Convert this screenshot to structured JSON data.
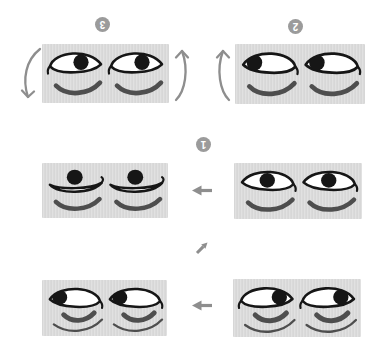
{
  "figure": {
    "kind": "instruction-diagram",
    "colors": {
      "background": "#ffffff",
      "card_fill": "#dcdcdc",
      "ink": "#161616",
      "sclera": "#ffffff",
      "underline_gray": "#4e4e4e",
      "arrow_gray": "#8e8e8e",
      "badge_gray": "#9b9b9b",
      "badge_text": "#ffffff"
    }
  },
  "badges": [
    {
      "id": "badge-3",
      "label": "3",
      "upside_down": true
    },
    {
      "id": "badge-2",
      "label": "2",
      "upside_down": true
    },
    {
      "id": "badge-1",
      "label": "1",
      "upside_down": true
    }
  ],
  "panels": [
    {
      "id": "card-step-3",
      "position": "top-left",
      "eyes": 2,
      "eye_style": "lid-left-curl",
      "gaze": "down-right",
      "pupil": {
        "x": 36,
        "y": 18
      },
      "under": "single"
    },
    {
      "id": "card-step-2",
      "position": "top-right",
      "eyes": 2,
      "eye_style": "lid-right-curl",
      "gaze": "down-left",
      "pupil": {
        "x": 16,
        "y": 18
      },
      "under": "single"
    },
    {
      "id": "card-result",
      "position": "middle-left",
      "eyes": 2,
      "eye_style": "boat",
      "gaze": "up",
      "pupil": {
        "x": 30,
        "y": 15
      },
      "under": "single"
    },
    {
      "id": "card-step-1",
      "position": "middle-right",
      "eyes": 2,
      "eye_style": "lid-right-curl",
      "gaze": "down-center",
      "pupil": {
        "x": 30,
        "y": 18
      },
      "under": "single"
    },
    {
      "id": "card-start-left",
      "position": "bottom-left",
      "eyes": 2,
      "eye_style": "lid-right-curl",
      "gaze": "left",
      "pupil": {
        "x": 15,
        "y": 18
      },
      "under": "double"
    },
    {
      "id": "card-start-right",
      "position": "bottom-right",
      "eyes": 2,
      "eye_style": "lid-left-curl",
      "gaze": "right",
      "pupil": {
        "x": 43,
        "y": 18
      },
      "under": "double"
    }
  ],
  "arrows": [
    {
      "id": "arrow-rotate-left",
      "type": "curved-down",
      "meaning": "left edge rotates down"
    },
    {
      "id": "arrow-rotate-right",
      "type": "curved-up",
      "meaning": "right edge rotates up"
    },
    {
      "id": "arrow-rotate-right2",
      "type": "curved-up",
      "meaning": "left edge of card 2 rotates up"
    },
    {
      "id": "arrow-mid-left",
      "type": "left",
      "meaning": "card 1 becomes middle-left card"
    },
    {
      "id": "arrow-diag",
      "type": "up-right",
      "meaning": "continue sequence upward"
    },
    {
      "id": "arrow-bottom-left",
      "type": "left",
      "meaning": "bottom-right card becomes bottom-left card"
    }
  ]
}
